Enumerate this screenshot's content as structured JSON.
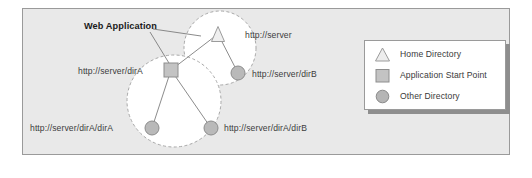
{
  "diagram": {
    "title_label": "Web Application",
    "nodes": [
      {
        "id": "home",
        "kind": "home-directory",
        "label": "http://server",
        "x": 218,
        "y": 34,
        "label_x": 245,
        "label_y": 31
      },
      {
        "id": "dirB",
        "kind": "other-directory",
        "label": "http://server/dirB",
        "x": 238,
        "y": 73,
        "label_x": 252,
        "label_y": 70
      },
      {
        "id": "dirA",
        "kind": "application-start",
        "label": "http://server/dirA",
        "x": 171,
        "y": 70,
        "label_x": 78,
        "label_y": 67
      },
      {
        "id": "dirA_dirA",
        "kind": "other-directory",
        "label": "http://server/dirA/dirA",
        "x": 152,
        "y": 128,
        "label_x": 30,
        "label_y": 124
      },
      {
        "id": "dirA_dirB",
        "kind": "other-directory",
        "label": "http://server/dirA/dirB",
        "x": 211,
        "y": 128,
        "label_x": 224,
        "label_y": 124
      }
    ],
    "edges": [
      {
        "from": "home",
        "to": "dirA"
      },
      {
        "from": "home",
        "to": "dirB"
      },
      {
        "from": "dirA",
        "to": "dirA_dirA"
      },
      {
        "from": "dirA",
        "to": "dirA_dirB"
      }
    ],
    "scopes": [
      {
        "id": "server-scope",
        "cx": 220,
        "cy": 48,
        "rx": 36,
        "ry": 37
      },
      {
        "id": "web-application-scope",
        "cx": 174,
        "cy": 101,
        "rx": 47,
        "ry": 46
      }
    ],
    "callout": {
      "label": "Web Application",
      "x": 84,
      "y": 22,
      "leaders": [
        {
          "x1": 153,
          "y1": 29,
          "x2": 201,
          "y2": 36
        },
        {
          "x1": 150,
          "y1": 32,
          "x2": 172,
          "y2": 68
        }
      ]
    }
  },
  "legend": {
    "items": [
      {
        "shape": "triangle-icon",
        "label": "Home Directory"
      },
      {
        "shape": "square-icon",
        "label": "Application Start Point"
      },
      {
        "shape": "circle-icon",
        "label": "Other Directory"
      }
    ]
  },
  "colors": {
    "panel_bg": "#e9e9e9",
    "panel_border": "#9a9a9a",
    "scope_fill": "#ffffff",
    "scope_border": "#a8a8a8",
    "node_fill": "#b9b9b9",
    "node_border": "#8c8c8c",
    "edge": "#8c8c8c",
    "text": "#3c3c3c",
    "legend_bg": "#ffffff",
    "legend_shadow": "#8e8e8e"
  }
}
